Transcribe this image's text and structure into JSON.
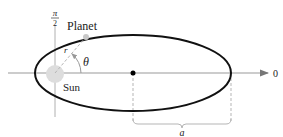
{
  "diagram": {
    "labels": {
      "pi_over_2_num": "π",
      "pi_over_2_den": "2",
      "planet": "Planet",
      "r": "r",
      "theta": "θ",
      "sun": "Sun",
      "zero": "0",
      "a": "a"
    },
    "colors": {
      "ellipse": "#111111",
      "axis": "#9a9a9a",
      "sun": "#dddddd",
      "planet": "#c8c8c8",
      "dashed": "#b5b5b5",
      "center_point": "#000000"
    }
  }
}
